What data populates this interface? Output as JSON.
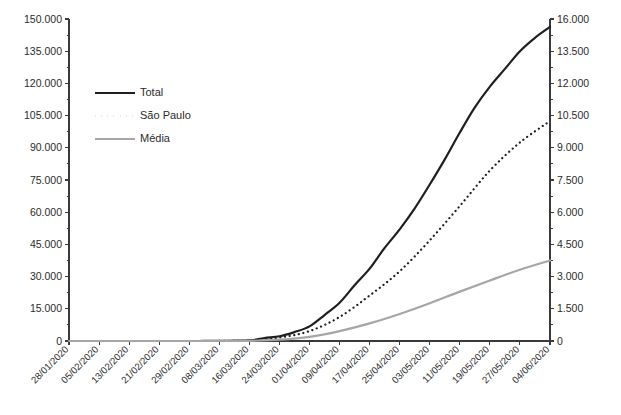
{
  "chart_data": {
    "type": "line",
    "title": "",
    "subtitle": "",
    "xlabel": "",
    "ylabel": "",
    "y2label": "",
    "grid": false,
    "legend_position": "top-left-inside",
    "ylim": [
      0,
      150000
    ],
    "y2lim": [
      0,
      16000
    ],
    "y_tick_labels": [
      "0",
      "15.000",
      "30.000",
      "45.000",
      "60.000",
      "75.000",
      "90.000",
      "105.000",
      "120.000",
      "135.000",
      "150.000"
    ],
    "y_tick_values": [
      0,
      15000,
      30000,
      45000,
      60000,
      75000,
      90000,
      105000,
      120000,
      135000,
      150000
    ],
    "y2_tick_labels": [
      "0",
      "1.500",
      "3.000",
      "4.500",
      "6.000",
      "7.500",
      "9.000",
      "10.500",
      "12.000",
      "13.500",
      "16.000"
    ],
    "y2_tick_values": [
      0,
      1500,
      3000,
      4500,
      6000,
      7500,
      9000,
      10500,
      12000,
      13500,
      16000
    ],
    "categories": [
      "28/01/2020",
      "05/02/2020",
      "13/02/2020",
      "21/02/2020",
      "29/02/2020",
      "08/03/2020",
      "16/03/2020",
      "24/03/2020",
      "01/04/2020",
      "09/04/2020",
      "17/04/2020",
      "25/04/2020",
      "03/05/2020",
      "11/05/2020",
      "19/05/2020",
      "27/05/2020",
      "04/06/2020"
    ],
    "series": [
      {
        "name": "Total",
        "axis": "left",
        "color": "#1f1f1f",
        "style": "solid",
        "width": 2.2,
        "values": [
          0,
          0,
          0,
          0,
          0,
          25,
          250,
          2200,
          6800,
          17800,
          33700,
          52000,
          72900,
          97100,
          118500,
          135000,
          146300
        ]
      },
      {
        "name": "São Paulo",
        "axis": "left",
        "color": "#1f1f1f",
        "style": "dotted",
        "width": 2.2,
        "values": [
          0,
          0,
          0,
          0,
          0,
          20,
          190,
          1600,
          4600,
          11200,
          21200,
          32500,
          46900,
          62900,
          79400,
          92500,
          102500
        ]
      },
      {
        "name": "Média",
        "axis": "left",
        "color": "#a6a6a6",
        "style": "solid",
        "width": 2.2,
        "values": [
          0,
          0,
          0,
          0,
          0,
          10,
          80,
          600,
          1900,
          4600,
          8200,
          12600,
          17600,
          23000,
          28200,
          33200,
          37500
        ]
      }
    ],
    "annotations": []
  },
  "legend": {
    "items": [
      {
        "label": "Total"
      },
      {
        "label": "São Paulo"
      },
      {
        "label": "Média"
      }
    ]
  },
  "colors": {
    "total": "#1f1f1f",
    "sao_paulo": "#1f1f1f",
    "media": "#a6a6a6",
    "axis": "#3a3a3a",
    "text": "#2b2b2b",
    "background": "#ffffff"
  }
}
